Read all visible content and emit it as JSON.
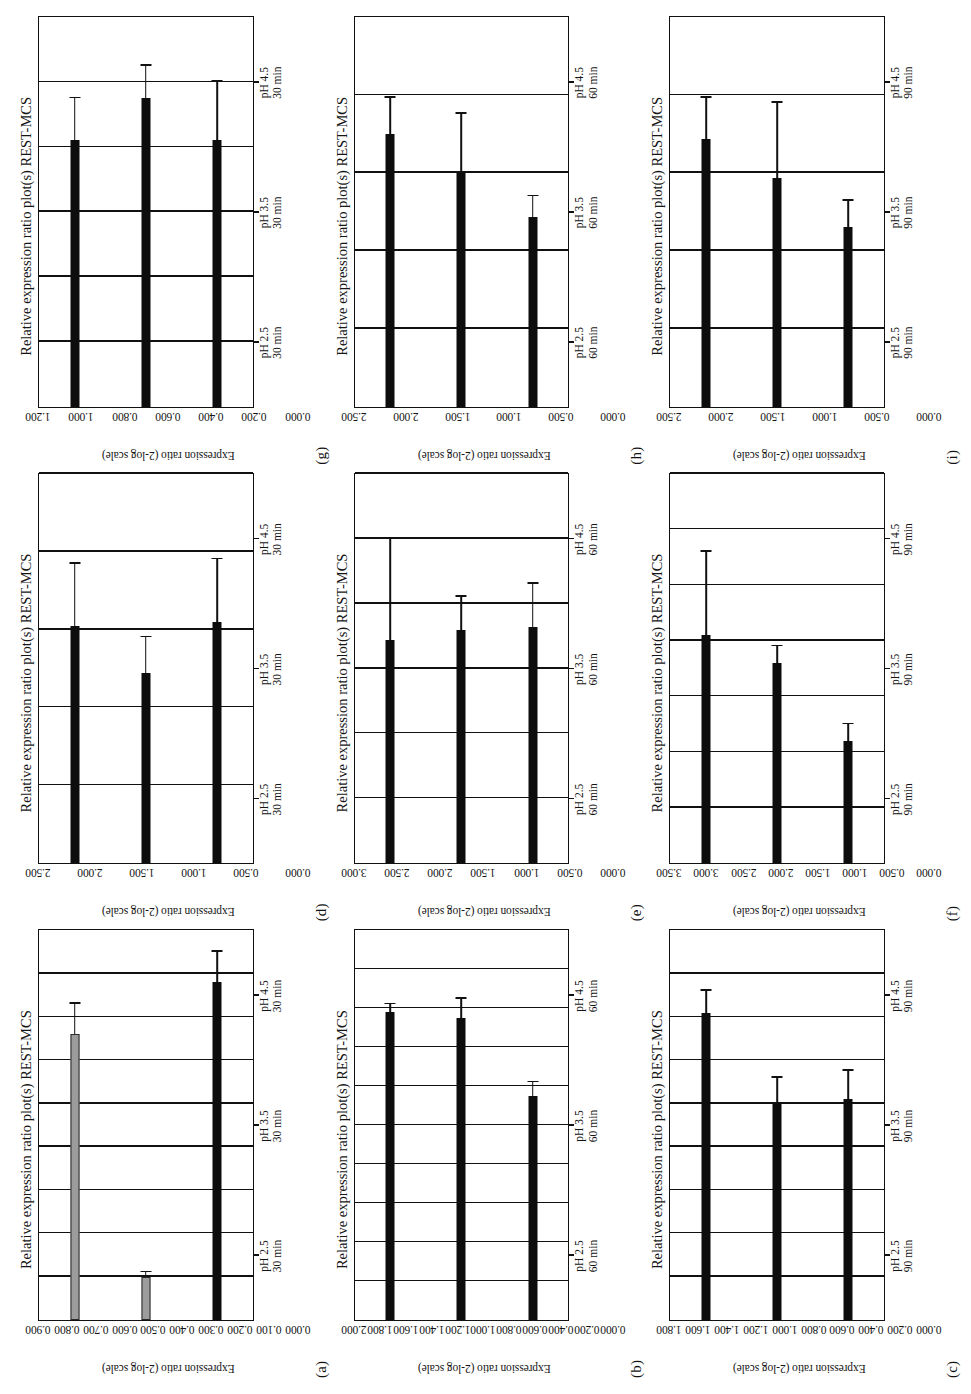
{
  "figure": {
    "common_title": "Relative expression ratio plot(s) REST-MCS",
    "y_axis_title": "Expression ratio (2-log scale)",
    "categories_by_time": {
      "30": [
        "pH 4.5\n30 min",
        "pH 3.5\n30 min",
        "pH 2.5\n30 min"
      ],
      "60": [
        "pH 4.5\n60 min",
        "pH 3.5\n60 min",
        "pH 2.5\n60 min"
      ],
      "90": [
        "pH 4.5\n90 min",
        "pH 3.5\n90 min",
        "pH 2.5\n90 min"
      ]
    },
    "colors": {
      "bar_black": "#0d0d0d",
      "bar_gray": "#9c9c9c",
      "axis": "#111111",
      "background": "#ffffff"
    }
  },
  "chart_data": [
    {
      "panel": "(a)",
      "type": "bar",
      "orientation": "horizontal",
      "title": "Relative expression ratio plot(s) REST-MCS",
      "xlabel": "",
      "ylabel": "Expression ratio (2-log scale)",
      "categories": [
        "pH 4.5 30 min",
        "pH 3.5 30 min",
        "pH 2.5 30 min"
      ],
      "cat_lines": [
        [
          "pH 4.5",
          "30 min"
        ],
        [
          "pH 3.5",
          "30 min"
        ],
        [
          "pH 2.5",
          "30 min"
        ]
      ],
      "values": [
        0.78,
        0.1,
        0.66
      ],
      "errors_upper": [
        0.85,
        0.11,
        0.73
      ],
      "bar_colors": [
        "black",
        "gray",
        "gray"
      ],
      "ylim": [
        0.0,
        0.9
      ],
      "ticks": [
        "0.000",
        "0.100",
        "0.200",
        "0.300",
        "0.400",
        "0.500",
        "0.600",
        "0.700",
        "0.800",
        "0.900"
      ],
      "tick_values": [
        0.0,
        0.1,
        0.2,
        0.3,
        0.4,
        0.5,
        0.6,
        0.7,
        0.8,
        0.9
      ],
      "grid": true,
      "legend": "none"
    },
    {
      "panel": "(b)",
      "type": "bar",
      "orientation": "horizontal",
      "title": "Relative expression ratio plot(s) REST-MCS",
      "xlabel": "",
      "ylabel": "Expression ratio (2-log scale)",
      "categories": [
        "pH 4.5 60 min",
        "pH 3.5 60 min",
        "pH 2.5 60 min"
      ],
      "cat_lines": [
        [
          "pH 4.5",
          "60 min"
        ],
        [
          "pH 3.5",
          "60 min"
        ],
        [
          "pH 2.5",
          "60 min"
        ]
      ],
      "values": [
        1.15,
        1.55,
        1.58
      ],
      "errors_upper": [
        1.22,
        1.65,
        1.62
      ],
      "bar_colors": [
        "black",
        "black",
        "black"
      ],
      "ylim": [
        0.0,
        2.0
      ],
      "ticks": [
        "0.000",
        "0.200",
        "0.400",
        "0.600",
        "0.800",
        "1.000",
        "1.200",
        "1.400",
        "1.600",
        "1.800",
        "2.000"
      ],
      "tick_values": [
        0.0,
        0.2,
        0.4,
        0.6,
        0.8,
        1.0,
        1.2,
        1.4,
        1.6,
        1.8,
        2.0
      ],
      "grid": true,
      "legend": "none"
    },
    {
      "panel": "(c)",
      "type": "bar",
      "orientation": "horizontal",
      "title": "Relative expression ratio plot(s) REST-MCS",
      "xlabel": "",
      "ylabel": "Expression ratio (2-log scale)",
      "categories": [
        "pH 4.5 90 min",
        "pH 3.5 90 min",
        "pH 2.5 90 min"
      ],
      "cat_lines": [
        [
          "pH 4.5",
          "90 min"
        ],
        [
          "pH 3.5",
          "90 min"
        ],
        [
          "pH 2.5",
          "90 min"
        ]
      ],
      "values": [
        1.02,
        1.0,
        1.42
      ],
      "errors_upper": [
        1.15,
        1.12,
        1.52
      ],
      "bar_colors": [
        "black",
        "black",
        "black"
      ],
      "ylim": [
        0.0,
        1.8
      ],
      "ticks": [
        "0.000",
        "0.200",
        "0.400",
        "0.600",
        "0.800",
        "1.000",
        "1.200",
        "1.400",
        "1.600",
        "1.800"
      ],
      "tick_values": [
        0.0,
        0.2,
        0.4,
        0.6,
        0.8,
        1.0,
        1.2,
        1.4,
        1.6,
        1.8
      ],
      "grid": true,
      "legend": "none"
    },
    {
      "panel": "(d)",
      "type": "bar",
      "orientation": "horizontal",
      "title": "Relative expression ratio plot(s) REST-MCS",
      "xlabel": "",
      "ylabel": "Expression ratio (2-log scale)",
      "categories": [
        "pH 4.5 30 min",
        "pH 3.5 30 min",
        "pH 2.5 30 min"
      ],
      "cat_lines": [
        [
          "pH 4.5",
          "30 min"
        ],
        [
          "pH 3.5",
          "30 min"
        ],
        [
          "pH 2.5",
          "30 min"
        ]
      ],
      "values": [
        1.55,
        1.22,
        1.52
      ],
      "errors_upper": [
        1.95,
        1.45,
        1.92
      ],
      "bar_colors": [
        "black",
        "black",
        "black"
      ],
      "ylim": [
        0.0,
        2.5
      ],
      "ticks": [
        "0.000",
        "0.500",
        "1.000",
        "1.500",
        "2.000",
        "2.500"
      ],
      "tick_values": [
        0.0,
        0.5,
        1.0,
        1.5,
        2.0,
        2.5
      ],
      "grid": true,
      "legend": "none"
    },
    {
      "panel": "(e)",
      "type": "bar",
      "orientation": "horizontal",
      "title": "Relative expression ratio plot(s) REST-MCS",
      "xlabel": "",
      "ylabel": "Expression ratio (2-log scale)",
      "categories": [
        "pH 4.5 60 min",
        "pH 3.5 60 min",
        "pH 2.5 60 min"
      ],
      "cat_lines": [
        [
          "pH 4.5",
          "60 min"
        ],
        [
          "pH 3.5",
          "60 min"
        ],
        [
          "pH 2.5",
          "60 min"
        ]
      ],
      "values": [
        1.82,
        1.8,
        1.72
      ],
      "errors_upper": [
        2.15,
        2.05,
        2.5
      ],
      "bar_colors": [
        "black",
        "black",
        "black"
      ],
      "ylim": [
        0.0,
        3.0
      ],
      "ticks": [
        "0.000",
        "0.500",
        "1.000",
        "1.500",
        "2.000",
        "2.500",
        "3.000"
      ],
      "tick_values": [
        0.0,
        0.5,
        1.0,
        1.5,
        2.0,
        2.5,
        3.0
      ],
      "grid": true,
      "legend": "none"
    },
    {
      "panel": "(f)",
      "type": "bar",
      "orientation": "horizontal",
      "title": "Relative expression ratio plot(s) REST-MCS",
      "xlabel": "",
      "ylabel": "Expression ratio (2-log scale)",
      "categories": [
        "pH 4.5 90 min",
        "pH 3.5 90 min",
        "pH 2.5 90 min"
      ],
      "cat_lines": [
        [
          "pH 4.5",
          "90 min"
        ],
        [
          "pH 3.5",
          "90 min"
        ],
        [
          "pH 2.5",
          "90 min"
        ]
      ],
      "values": [
        1.1,
        1.8,
        2.05
      ],
      "errors_upper": [
        1.25,
        1.95,
        2.8
      ],
      "bar_colors": [
        "black",
        "black",
        "black"
      ],
      "ylim": [
        0.0,
        3.5
      ],
      "ticks": [
        "0.000",
        "0.500",
        "1.000",
        "1.500",
        "2.000",
        "2.500",
        "3.000",
        "3.500"
      ],
      "tick_values": [
        0.0,
        0.5,
        1.0,
        1.5,
        2.0,
        2.5,
        3.0,
        3.5
      ],
      "grid": true,
      "legend": "none"
    },
    {
      "panel": "(g)",
      "type": "bar",
      "orientation": "horizontal",
      "title": "Relative expression ratio plot(s) REST-MCS",
      "xlabel": "",
      "ylabel": "Expression ratio (2-log scale)",
      "categories": [
        "pH 4.5 30 min",
        "pH 3.5 30 min",
        "pH 2.5 30 min"
      ],
      "cat_lines": [
        [
          "pH 4.5",
          "30 min"
        ],
        [
          "pH 3.5",
          "30 min"
        ],
        [
          "pH 2.5",
          "30 min"
        ]
      ],
      "values": [
        0.82,
        0.95,
        0.82
      ],
      "errors_upper": [
        1.0,
        1.05,
        0.95
      ],
      "bar_colors": [
        "black",
        "black",
        "black"
      ],
      "ylim": [
        0.0,
        1.2
      ],
      "ticks": [
        "0.000",
        "0.200",
        "0.400",
        "0.600",
        "0.800",
        "1.000",
        "1.200"
      ],
      "tick_values": [
        0.0,
        0.2,
        0.4,
        0.6,
        0.8,
        1.0,
        1.2
      ],
      "grid": true,
      "legend": "none"
    },
    {
      "panel": "(h)",
      "type": "bar",
      "orientation": "horizontal",
      "title": "Relative expression ratio plot(s) REST-MCS",
      "xlabel": "",
      "ylabel": "Expression ratio (2-log scale)",
      "categories": [
        "pH 4.5 60 min",
        "pH 3.5 60 min",
        "pH 2.5 60 min"
      ],
      "cat_lines": [
        [
          "pH 4.5",
          "60 min"
        ],
        [
          "pH 3.5",
          "60 min"
        ],
        [
          "pH 2.5",
          "60 min"
        ]
      ],
      "values": [
        1.22,
        1.5,
        1.75
      ],
      "errors_upper": [
        1.35,
        1.88,
        1.98
      ],
      "bar_colors": [
        "black",
        "black",
        "black"
      ],
      "ylim": [
        0.0,
        2.5
      ],
      "ticks": [
        "0.000",
        "0.500",
        "1.000",
        "1.500",
        "2.000",
        "2.500"
      ],
      "tick_values": [
        0.0,
        0.5,
        1.0,
        1.5,
        2.0,
        2.5
      ],
      "grid": true,
      "legend": "none"
    },
    {
      "panel": "(i)",
      "type": "bar",
      "orientation": "horizontal",
      "title": "Relative expression ratio plot(s) REST-MCS",
      "xlabel": "",
      "ylabel": "Expression ratio (2-log scale)",
      "categories": [
        "pH 4.5 90 min",
        "pH 3.5 90 min",
        "pH 2.5 90 min"
      ],
      "cat_lines": [
        [
          "pH 4.5",
          "90 min"
        ],
        [
          "pH 3.5",
          "90 min"
        ],
        [
          "pH 2.5",
          "90 min"
        ]
      ],
      "values": [
        1.15,
        1.47,
        1.72
      ],
      "errors_upper": [
        1.32,
        1.95,
        1.98
      ],
      "bar_colors": [
        "black",
        "black",
        "black"
      ],
      "ylim": [
        0.0,
        2.5
      ],
      "ticks": [
        "0.000",
        "0.500",
        "1.000",
        "1.500",
        "2.000",
        "2.500"
      ],
      "tick_values": [
        0.0,
        0.5,
        1.0,
        1.5,
        2.0,
        2.5
      ],
      "grid": true,
      "legend": "none"
    }
  ]
}
